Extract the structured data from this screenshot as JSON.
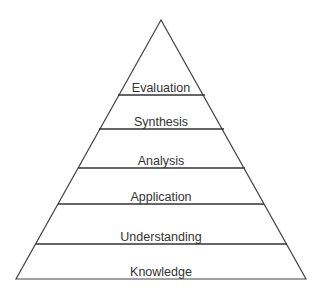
{
  "diagram": {
    "type": "pyramid",
    "levels_top_to_bottom": [
      {
        "label": "Evaluation"
      },
      {
        "label": "Synthesis"
      },
      {
        "label": "Analysis"
      },
      {
        "label": "Application"
      },
      {
        "label": "Understanding"
      },
      {
        "label": "Knowledge"
      }
    ],
    "line_color": "#333333",
    "background": "#ffffff"
  }
}
